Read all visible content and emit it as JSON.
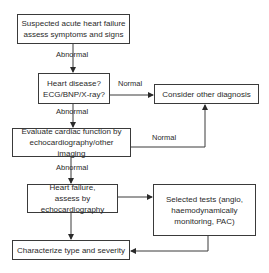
{
  "diagram": {
    "type": "flowchart",
    "nodes": {
      "start": "Suspected acute heart failure assess symptoms and signs",
      "heart_disease": "Heart disease? ECG/BNP/X-ray?",
      "other_diagnosis": "Consider other diagnosis",
      "evaluate": "Evaluate cardiac function by echocardiography/other imaging",
      "hf_assess": "Heart failure, assess by echocardiography",
      "selected_tests": "Selected tests (angio, haemodynamically monitoring, PAC)",
      "characterize": "Characterize type and severity"
    },
    "edge_labels": {
      "start_to_hd": "Abnormal",
      "hd_to_other": "Normal",
      "hd_to_eval": "Abnormal",
      "eval_to_other": "Normal",
      "eval_to_hf": "Abnormal"
    },
    "colors": {
      "line": "#3a3a3a",
      "background": "#ffffff"
    }
  }
}
